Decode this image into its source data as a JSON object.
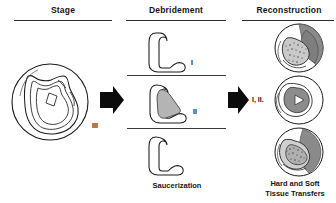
{
  "figure": {
    "type": "medical-treatment-flow-diagram",
    "background_color": "#ffffff",
    "ink_color": "#151515",
    "fill_gray_light": "#b9b9b9",
    "fill_gray_mid": "#8f8f8f",
    "fill_gray_dark": "#6e6e6e"
  },
  "columns": {
    "stage": {
      "header": "Stage",
      "stage_label": "III"
    },
    "debridement": {
      "header": "Debridement",
      "panels": [
        {
          "label": "I"
        },
        {
          "label": "II"
        },
        {
          "label": ""
        }
      ],
      "caption": "Saucerization"
    },
    "reconstruction": {
      "header": "Reconstruction",
      "transition_label": "I, II.",
      "caption_line1": "Hard and Soft",
      "caption_line2": "Tissue Transfers"
    }
  },
  "arrows": [
    {
      "name": "arrow-stage-to-debridement",
      "direction": "right"
    },
    {
      "name": "arrow-debridement-to-reconstruction",
      "direction": "right"
    }
  ]
}
